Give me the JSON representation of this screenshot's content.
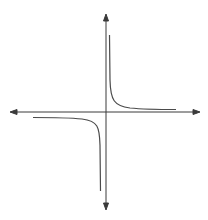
{
  "figure": {
    "function": "y = k/x",
    "branches": [
      "quadrant-I",
      "quadrant-III"
    ],
    "asymptotes": [
      "x = 0",
      "y = 0"
    ]
  },
  "colors": {
    "background": "#ffffff",
    "axis": "#3a3a3a",
    "curve": "#4a4a4a"
  },
  "axes": {
    "x_axis": {
      "arrows": "both-ends",
      "labels": []
    },
    "y_axis": {
      "arrows": "both-ends",
      "labels": []
    }
  }
}
